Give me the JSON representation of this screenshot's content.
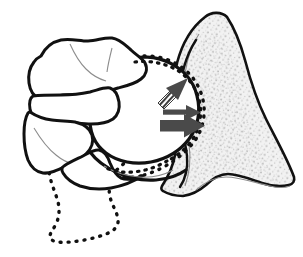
{
  "figure": {
    "background_color": "#ffffff",
    "width": 303,
    "height": 257
  },
  "style": {
    "outline_color": "#111111",
    "dotted_color": "#111111",
    "arrow_color": "#4a4a4a",
    "arrow_dark_color": "#3d3d3d",
    "bone_fill": "#ffffff",
    "cancellous_fill": "#efefef",
    "stipple_color": "#b8b8b8",
    "thin_line_color": "#8d8d8d"
  },
  "structures": [
    {
      "id": "femoral-head",
      "label": "Femoral head",
      "rendering": "solid-outline-circle",
      "fill": "#ffffff",
      "stroke": "#111111",
      "stroke_width": 3.2
    },
    {
      "id": "fracture-fragments",
      "label": "Displaced bone fragments",
      "rendering": "solid-outline-irregular",
      "fill": "#ffffff",
      "stroke": "#111111",
      "stroke_width": 3.0
    },
    {
      "id": "original-position-outline",
      "label": "Original (pre-displacement) position",
      "rendering": "dotted-outline",
      "stroke": "#111111",
      "dash": "1 7"
    },
    {
      "id": "acetabulum",
      "label": "Acetabulum / iliac wing",
      "rendering": "stippled-cancellous-bone",
      "fill": "#efefef",
      "stroke": "#111111",
      "stroke_width": 2.6
    },
    {
      "id": "joint-space",
      "label": "Joint space / articular line",
      "rendering": "dotted-arc",
      "stroke": "#111111"
    }
  ],
  "annotations": {
    "arrows": [
      {
        "id": "arrow-hatched",
        "name": "hatched-force-arrow",
        "style": "hatched-shaft",
        "direction": "up-right",
        "meaning": "Direction of reduction force"
      },
      {
        "id": "arrow-thin",
        "name": "thin-force-arrow",
        "style": "solid-thin",
        "direction": "right",
        "meaning": "Direction of displacement"
      },
      {
        "id": "arrow-thick",
        "name": "thick-force-arrow",
        "style": "solid-thick",
        "direction": "right",
        "meaning": "Direction of primary impaction force"
      }
    ]
  }
}
